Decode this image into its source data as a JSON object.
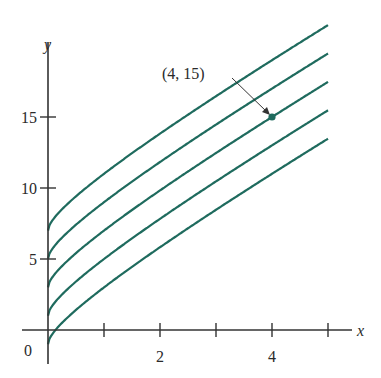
{
  "chart_data": {
    "type": "line",
    "title": "",
    "xlabel": "x",
    "ylabel": "y",
    "xlim": [
      0,
      5.5
    ],
    "ylim": [
      -1,
      22
    ],
    "x_ticks": [
      0,
      1,
      2,
      3,
      4,
      5
    ],
    "x_tick_labels": {
      "2": "2",
      "4": "4"
    },
    "y_ticks": [
      5,
      10,
      15
    ],
    "y_tick_labels": [
      "5",
      "10",
      "15"
    ],
    "origin_label": "0",
    "grid": false,
    "legend": null,
    "series": [
      {
        "name": "C = 7",
        "function": "y = 2x + 2*sqrt(x) + 7"
      },
      {
        "name": "C = 5",
        "function": "y = 2x + 2*sqrt(x) + 5"
      },
      {
        "name": "C = 3",
        "function": "y = 2x + 2*sqrt(x) + 3"
      },
      {
        "name": "C = 1",
        "function": "y = 2x + 2*sqrt(x) + 1"
      },
      {
        "name": "C = -1",
        "function": "y = 2x + 2*sqrt(x) - 1"
      }
    ],
    "x": [
      0,
      0.25,
      0.5,
      1,
      1.5,
      2,
      2.5,
      3,
      3.5,
      4,
      4.5,
      5
    ],
    "offsets": [
      7,
      5,
      3,
      1,
      -1
    ],
    "annotation": {
      "text": "(4, 15)",
      "point": [
        4,
        15
      ]
    },
    "line_color": "#1f6b5e"
  }
}
